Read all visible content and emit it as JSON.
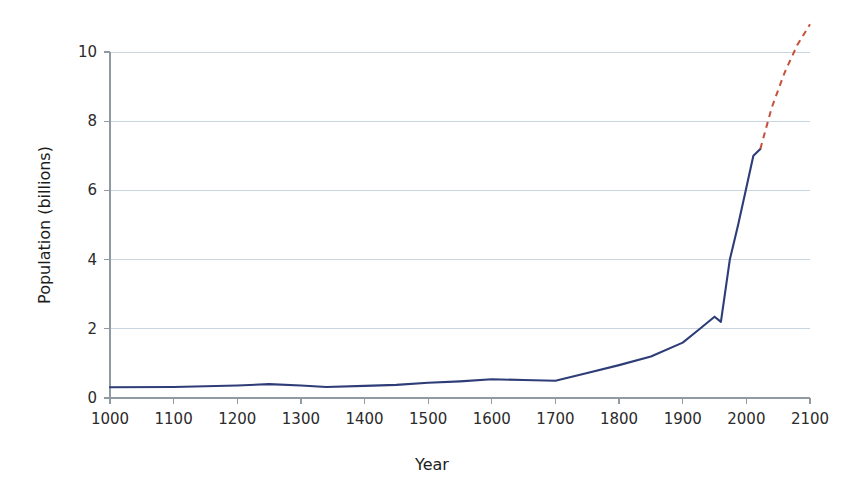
{
  "chart_data": {
    "type": "line",
    "title": "",
    "xlabel": "Year",
    "ylabel": "Population (billions)",
    "xlim": [
      1000,
      2100
    ],
    "ylim": [
      0,
      10.9
    ],
    "xticks": [
      1000,
      1100,
      1200,
      1300,
      1400,
      1500,
      1600,
      1700,
      1800,
      1900,
      2000,
      2100
    ],
    "yticks": [
      0,
      2,
      4,
      6,
      8,
      10
    ],
    "xtick_labels": [
      "1000",
      "1100",
      "1200",
      "1300",
      "1400",
      "1500",
      "1600",
      "1700",
      "1800",
      "1900",
      "2000",
      "2100"
    ],
    "ytick_labels": [
      "0",
      "2",
      "4",
      "6",
      "8",
      "10"
    ],
    "grid": "horizontal",
    "legend": "none",
    "series": [
      {
        "name": "Historical population",
        "style": "solid",
        "color": "#2e3d78",
        "width": 2.1,
        "x": [
          1000,
          1100,
          1200,
          1250,
          1300,
          1340,
          1400,
          1450,
          1500,
          1550,
          1600,
          1650,
          1700,
          1750,
          1800,
          1850,
          1900,
          1927,
          1950,
          1960,
          1974,
          1987,
          1999,
          2011,
          2022
        ],
        "values": [
          0.31,
          0.32,
          0.36,
          0.4,
          0.36,
          0.32,
          0.35,
          0.38,
          0.44,
          0.48,
          0.54,
          0.52,
          0.5,
          0.72,
          0.95,
          1.2,
          1.6,
          2.0,
          2.35,
          2.2,
          4.0,
          5.0,
          6.0,
          7.0,
          7.2
        ]
      },
      {
        "name": "Projected population",
        "style": "dashed",
        "color": "#c4513a",
        "width": 2.0,
        "x": [
          2022,
          2040,
          2060,
          2080,
          2100
        ],
        "values": [
          7.2,
          8.4,
          9.4,
          10.2,
          10.8
        ]
      }
    ]
  },
  "axes": {
    "y_title": "Population (billions)",
    "x_title": "Year"
  },
  "colors": {
    "historical": "#2e3d78",
    "projection": "#c4513a",
    "grid": "#c8d6e0",
    "axis": "#8f9aa3",
    "text": "#2b2b2b"
  }
}
